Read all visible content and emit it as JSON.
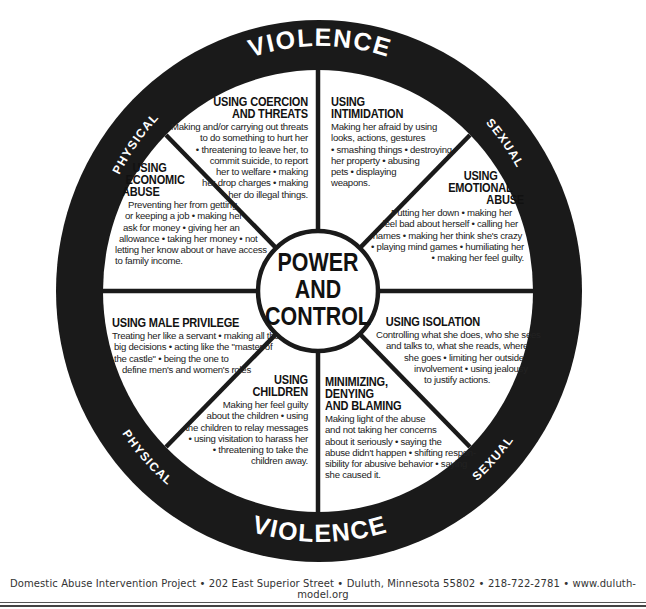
{
  "wheel": {
    "center_label": [
      "POWER",
      "AND",
      "CONTROL"
    ],
    "outer_ring": {
      "top": {
        "left_word": "PHYSICAL",
        "main_word": "VIOLENCE",
        "right_word": "SEXUAL"
      },
      "bottom": {
        "left_word": "PHYSICAL",
        "main_word": "VIOLENCE",
        "right_word": "SEXUAL"
      }
    },
    "colors": {
      "ring": "#1a1a1a",
      "background": "#ffffff",
      "ring_text": "#ffffff",
      "body_text": "#222222"
    },
    "sections": [
      {
        "id": "coercion",
        "title": [
          "USING COERCION",
          "AND THREATS"
        ],
        "body": [
          "Making and/or carrying out threats",
          "to do something to hurt her",
          "• threatening to leave her, to",
          "commit suicide, to report",
          "her to welfare • making",
          "her drop charges • making",
          "her do illegal things."
        ]
      },
      {
        "id": "intimidation",
        "title": [
          "USING",
          "INTIMIDATION"
        ],
        "body": [
          "Making her afraid by using",
          "looks, actions, gestures",
          "• smashing things • destroying",
          "her property • abusing",
          "pets • displaying",
          "weapons."
        ]
      },
      {
        "id": "emotional",
        "title": [
          "USING",
          "EMOTIONAL",
          "ABUSE"
        ],
        "body": [
          "Putting her down • making her",
          "feel bad about herself • calling her",
          "names • making her think she's crazy",
          "• playing mind games • humiliating her",
          "• making her feel guilty."
        ]
      },
      {
        "id": "isolation",
        "title": [
          "USING ISOLATION"
        ],
        "body": [
          "Controlling what she does, who she sees",
          "and talks to, what she reads, where",
          "she goes • limiting her outside",
          "involvement • using jealousy",
          "to justify actions."
        ]
      },
      {
        "id": "minimizing",
        "title": [
          "MINIMIZING,",
          "DENYING",
          "AND BLAMING"
        ],
        "body": [
          "Making light of the abuse",
          "and not taking her concerns",
          "about it seriously • saying the",
          "abuse didn't happen • shifting respon-",
          "sibility for abusive behavior • saying",
          "she caused it."
        ]
      },
      {
        "id": "children",
        "title": [
          "USING",
          "CHILDREN"
        ],
        "body": [
          "Making her feel guilty",
          "about the children • using",
          "the children to relay messages",
          "• using visitation to harass her",
          "• threatening to take the",
          "children away."
        ]
      },
      {
        "id": "male-privilege",
        "title": [
          "USING MALE PRIVILEGE"
        ],
        "body": [
          "Treating her like a servant • making all the",
          "big decisions • acting like the \"master of",
          "the castle\"  • being the one to",
          "define men's and women's roles"
        ]
      },
      {
        "id": "economic",
        "title": [
          "USING",
          "ECONOMIC",
          "ABUSE"
        ],
        "body": [
          "Preventing her from getting",
          "or keeping a job • making her",
          "ask for money • giving her an",
          "allowance • taking her money • not",
          "letting her know about or have access",
          "to family income."
        ]
      }
    ]
  },
  "footer": {
    "text": "Domestic Abuse Intervention Project • 202 East Superior Street • Duluth, Minnesota 55802 • 218-722-2781 • www.duluth-model.org"
  }
}
